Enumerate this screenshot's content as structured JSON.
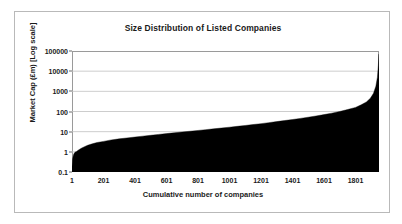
{
  "chart_data": {
    "type": "area",
    "title": "Size Distribution of Listed Companies",
    "xlabel": "Cumulative number of companies",
    "ylabel": "Market Cap (£m) [Log scale]",
    "yscale": "log",
    "ylim": [
      0.1,
      100000
    ],
    "xlim": [
      1,
      1950
    ],
    "grid": true,
    "legend": "none",
    "series_name": "Market capitalisation",
    "fill_color": "#000000",
    "gridline_color": "#c0c0c0",
    "axis_color": "#9a9a9a",
    "ytick_labels": [
      "100000",
      "10000",
      "1000",
      "100",
      "10",
      "1",
      "0.1"
    ],
    "ytick_values": [
      100000,
      10000,
      1000,
      100,
      10,
      1,
      0.1
    ],
    "xtick_labels": [
      "1",
      "201",
      "401",
      "601",
      "801",
      "1001",
      "1201",
      "1401",
      "1601",
      "1801"
    ],
    "xtick_values": [
      1,
      201,
      401,
      601,
      801,
      1001,
      1201,
      1401,
      1601,
      1801
    ],
    "x": [
      1,
      5,
      10,
      15,
      20,
      30,
      40,
      60,
      80,
      100,
      130,
      160,
      201,
      250,
      300,
      350,
      401,
      450,
      500,
      550,
      601,
      650,
      700,
      750,
      801,
      850,
      900,
      950,
      1001,
      1050,
      1100,
      1150,
      1201,
      1250,
      1300,
      1350,
      1401,
      1450,
      1500,
      1550,
      1601,
      1650,
      1700,
      1750,
      1801,
      1840,
      1870,
      1895,
      1915,
      1930,
      1940,
      1946,
      1950
    ],
    "values": [
      0.18,
      0.45,
      0.7,
      0.85,
      0.95,
      1.05,
      1.2,
      1.5,
      1.8,
      2.1,
      2.5,
      2.9,
      3.3,
      3.9,
      4.4,
      4.9,
      5.4,
      6.0,
      6.6,
      7.3,
      8.0,
      8.8,
      9.6,
      10.5,
      11.5,
      12.6,
      13.8,
      15.2,
      16.7,
      18.4,
      20.3,
      22.5,
      25.0,
      28.0,
      31.5,
      35.5,
      40.0,
      45.5,
      52.0,
      60.0,
      70.0,
      83.0,
      100.0,
      125.0,
      160.0,
      220.0,
      300.0,
      450.0,
      800.0,
      1800.0,
      5000.0,
      20000.0,
      70000.0
    ]
  }
}
